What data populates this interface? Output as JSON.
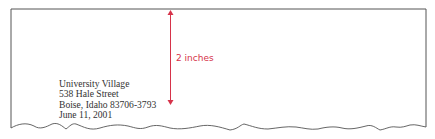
{
  "measurement": {
    "label": "2 inches",
    "color": "#d6334a"
  },
  "letter": {
    "heading_lines": [
      "University Village",
      "538 Hale Street",
      "Boise, Idaho 83706-3793",
      "June 11, 2001"
    ]
  }
}
